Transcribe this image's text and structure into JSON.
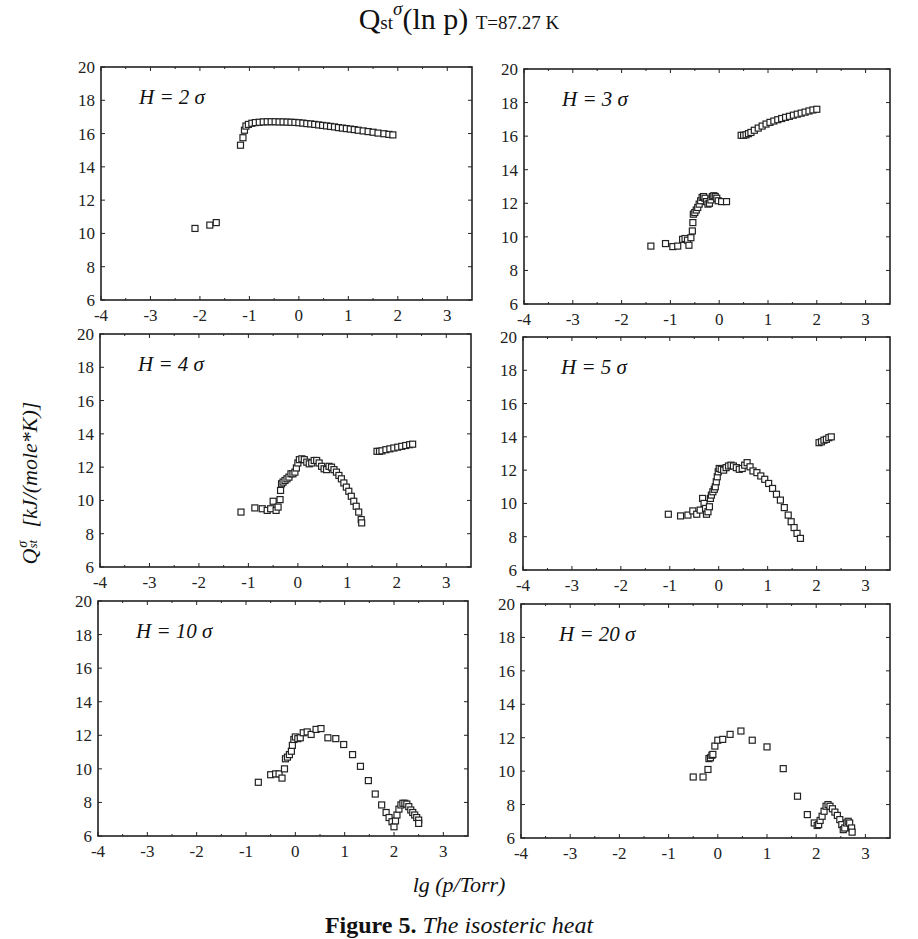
{
  "figure": {
    "title_main": "Q",
    "title_sub": "st",
    "title_sup": "σ",
    "title_rest": "(ln p)",
    "title_temp": "T=87.27 K",
    "ylabel_main": "Q",
    "ylabel_sub": "st",
    "ylabel_sup": "σ",
    "ylabel_units": "[kJ/(mole*K)]",
    "xlabel": "lg (p/Torr)",
    "caption_label": "Figure 5.",
    "caption_text": "The isosteric heat"
  },
  "chart_data": [
    {
      "type": "scatter",
      "panel": "top-left",
      "title": "H = 2 σ",
      "xlabel": "lg (p/Torr)",
      "ylabel": "Qst σ [kJ/(mole*K)]",
      "xlim": [
        -4,
        3.5
      ],
      "ylim": [
        6,
        20
      ],
      "xticks": [
        -4,
        -3,
        -2,
        -1,
        0,
        1,
        2,
        3
      ],
      "yticks": [
        6,
        8,
        10,
        12,
        14,
        16,
        18,
        20
      ],
      "marker": "open-square",
      "grid": false,
      "points": [
        [
          -2.1,
          10.3
        ],
        [
          -1.8,
          10.5
        ],
        [
          -1.67,
          10.65
        ],
        [
          -1.18,
          15.3
        ],
        [
          -1.13,
          15.75
        ],
        [
          -1.1,
          16.2
        ],
        [
          -1.07,
          16.45
        ],
        [
          -1.02,
          16.55
        ],
        [
          -0.95,
          16.62
        ],
        [
          -0.88,
          16.66
        ],
        [
          -0.8,
          16.68
        ],
        [
          -0.72,
          16.7
        ],
        [
          -0.64,
          16.71
        ],
        [
          -0.56,
          16.71
        ],
        [
          -0.48,
          16.71
        ],
        [
          -0.4,
          16.7
        ],
        [
          -0.32,
          16.7
        ],
        [
          -0.24,
          16.69
        ],
        [
          -0.16,
          16.68
        ],
        [
          -0.08,
          16.67
        ],
        [
          0.0,
          16.65
        ],
        [
          0.08,
          16.63
        ],
        [
          0.16,
          16.6
        ],
        [
          0.24,
          16.58
        ],
        [
          0.32,
          16.55
        ],
        [
          0.4,
          16.52
        ],
        [
          0.48,
          16.49
        ],
        [
          0.56,
          16.46
        ],
        [
          0.64,
          16.43
        ],
        [
          0.72,
          16.4
        ],
        [
          0.8,
          16.36
        ],
        [
          0.88,
          16.33
        ],
        [
          0.96,
          16.3
        ],
        [
          1.04,
          16.27
        ],
        [
          1.12,
          16.24
        ],
        [
          1.2,
          16.2
        ],
        [
          1.3,
          16.16
        ],
        [
          1.4,
          16.12
        ],
        [
          1.5,
          16.08
        ],
        [
          1.6,
          16.03
        ],
        [
          1.72,
          15.99
        ],
        [
          1.82,
          15.95
        ],
        [
          1.9,
          15.92
        ]
      ]
    },
    {
      "type": "scatter",
      "panel": "top-right",
      "title": "H = 3 σ",
      "xlim": [
        -4,
        3.5
      ],
      "ylim": [
        6,
        20
      ],
      "xticks": [
        -4,
        -3,
        -2,
        -1,
        0,
        1,
        2,
        3
      ],
      "yticks": [
        6,
        8,
        10,
        12,
        14,
        16,
        18,
        20
      ],
      "marker": "open-square",
      "points": [
        [
          -1.4,
          9.45
        ],
        [
          -1.1,
          9.6
        ],
        [
          -0.95,
          9.42
        ],
        [
          -0.85,
          9.45
        ],
        [
          -0.75,
          9.85
        ],
        [
          -0.7,
          9.9
        ],
        [
          -0.65,
          9.8
        ],
        [
          -0.62,
          9.5
        ],
        [
          -0.58,
          9.95
        ],
        [
          -0.55,
          10.35
        ],
        [
          -0.54,
          10.85
        ],
        [
          -0.53,
          11.35
        ],
        [
          -0.5,
          11.45
        ],
        [
          -0.47,
          11.6
        ],
        [
          -0.44,
          11.75
        ],
        [
          -0.41,
          11.95
        ],
        [
          -0.38,
          12.15
        ],
        [
          -0.35,
          12.35
        ],
        [
          -0.32,
          12.4
        ],
        [
          -0.29,
          12.3
        ],
        [
          -0.26,
          12.1
        ],
        [
          -0.23,
          11.95
        ],
        [
          -0.2,
          12.0
        ],
        [
          -0.17,
          12.2
        ],
        [
          -0.14,
          12.4
        ],
        [
          -0.11,
          12.45
        ],
        [
          -0.08,
          12.4
        ],
        [
          -0.05,
          12.3
        ],
        [
          -0.02,
          12.15
        ],
        [
          0.05,
          12.1
        ],
        [
          0.15,
          12.1
        ],
        [
          0.45,
          16.05
        ],
        [
          0.5,
          16.05
        ],
        [
          0.55,
          16.08
        ],
        [
          0.6,
          16.15
        ],
        [
          0.65,
          16.22
        ],
        [
          0.72,
          16.35
        ],
        [
          0.8,
          16.48
        ],
        [
          0.88,
          16.6
        ],
        [
          0.96,
          16.72
        ],
        [
          1.04,
          16.82
        ],
        [
          1.12,
          16.9
        ],
        [
          1.2,
          16.98
        ],
        [
          1.28,
          17.05
        ],
        [
          1.36,
          17.12
        ],
        [
          1.44,
          17.18
        ],
        [
          1.52,
          17.25
        ],
        [
          1.6,
          17.31
        ],
        [
          1.68,
          17.37
        ],
        [
          1.76,
          17.43
        ],
        [
          1.84,
          17.5
        ],
        [
          1.92,
          17.56
        ],
        [
          2.0,
          17.6
        ]
      ]
    },
    {
      "type": "scatter",
      "panel": "middle-left",
      "title": "H = 4 σ",
      "xlim": [
        -4,
        3.5
      ],
      "ylim": [
        6,
        20
      ],
      "xticks": [
        -4,
        -3,
        -2,
        -1,
        0,
        1,
        2,
        3
      ],
      "yticks": [
        6,
        8,
        10,
        12,
        14,
        16,
        18,
        20
      ],
      "marker": "open-square",
      "points": [
        [
          -1.15,
          9.3
        ],
        [
          -0.87,
          9.55
        ],
        [
          -0.72,
          9.5
        ],
        [
          -0.62,
          9.4
        ],
        [
          -0.55,
          9.5
        ],
        [
          -0.5,
          9.95
        ],
        [
          -0.44,
          9.4
        ],
        [
          -0.4,
          9.6
        ],
        [
          -0.36,
          10.05
        ],
        [
          -0.35,
          10.6
        ],
        [
          -0.33,
          11.0
        ],
        [
          -0.3,
          11.1
        ],
        [
          -0.26,
          11.2
        ],
        [
          -0.22,
          11.3
        ],
        [
          -0.18,
          11.4
        ],
        [
          -0.14,
          11.6
        ],
        [
          -0.1,
          11.6
        ],
        [
          -0.06,
          11.7
        ],
        [
          -0.03,
          11.95
        ],
        [
          0.0,
          12.25
        ],
        [
          0.03,
          12.45
        ],
        [
          0.08,
          12.5
        ],
        [
          0.13,
          12.45
        ],
        [
          0.18,
          12.3
        ],
        [
          0.23,
          12.2
        ],
        [
          0.28,
          12.25
        ],
        [
          0.33,
          12.4
        ],
        [
          0.38,
          12.4
        ],
        [
          0.43,
          12.25
        ],
        [
          0.48,
          12.05
        ],
        [
          0.53,
          11.9
        ],
        [
          0.58,
          11.85
        ],
        [
          0.63,
          12.05
        ],
        [
          0.68,
          12.0
        ],
        [
          0.73,
          11.85
        ],
        [
          0.78,
          11.7
        ],
        [
          0.83,
          11.5
        ],
        [
          0.88,
          11.3
        ],
        [
          0.93,
          11.05
        ],
        [
          0.98,
          10.8
        ],
        [
          1.03,
          10.55
        ],
        [
          1.08,
          10.25
        ],
        [
          1.13,
          9.95
        ],
        [
          1.18,
          9.65
        ],
        [
          1.23,
          9.3
        ],
        [
          1.28,
          8.85
        ],
        [
          1.29,
          8.65
        ],
        [
          1.6,
          12.95
        ],
        [
          1.65,
          12.95
        ],
        [
          1.7,
          12.98
        ],
        [
          1.78,
          13.05
        ],
        [
          1.86,
          13.1
        ],
        [
          1.94,
          13.15
        ],
        [
          2.02,
          13.2
        ],
        [
          2.1,
          13.25
        ],
        [
          2.18,
          13.3
        ],
        [
          2.26,
          13.35
        ],
        [
          2.32,
          13.38
        ]
      ]
    },
    {
      "type": "scatter",
      "panel": "middle-right",
      "title": "H = 5 σ",
      "xlim": [
        -4,
        3.5
      ],
      "ylim": [
        6,
        20
      ],
      "xticks": [
        -4,
        -3,
        -2,
        -1,
        0,
        1,
        2,
        3
      ],
      "yticks": [
        6,
        8,
        10,
        12,
        14,
        16,
        18,
        20
      ],
      "marker": "open-square",
      "points": [
        [
          -1.03,
          9.35
        ],
        [
          -0.78,
          9.25
        ],
        [
          -0.63,
          9.3
        ],
        [
          -0.53,
          9.55
        ],
        [
          -0.45,
          9.35
        ],
        [
          -0.38,
          9.6
        ],
        [
          -0.33,
          10.3
        ],
        [
          -0.3,
          10.0
        ],
        [
          -0.27,
          9.7
        ],
        [
          -0.25,
          9.35
        ],
        [
          -0.22,
          9.5
        ],
        [
          -0.19,
          9.8
        ],
        [
          -0.17,
          10.3
        ],
        [
          -0.15,
          10.5
        ],
        [
          -0.12,
          10.7
        ],
        [
          -0.09,
          10.85
        ],
        [
          -0.07,
          11.0
        ],
        [
          -0.05,
          11.3
        ],
        [
          -0.03,
          11.6
        ],
        [
          -0.01,
          11.9
        ],
        [
          0.01,
          12.1
        ],
        [
          0.05,
          12.05
        ],
        [
          0.1,
          12.0
        ],
        [
          0.15,
          12.15
        ],
        [
          0.2,
          12.25
        ],
        [
          0.25,
          12.3
        ],
        [
          0.3,
          12.25
        ],
        [
          0.36,
          12.15
        ],
        [
          0.42,
          12.05
        ],
        [
          0.48,
          12.1
        ],
        [
          0.53,
          12.3
        ],
        [
          0.58,
          12.45
        ],
        [
          0.64,
          12.2
        ],
        [
          0.7,
          11.95
        ],
        [
          0.78,
          11.85
        ],
        [
          0.86,
          11.65
        ],
        [
          0.94,
          11.45
        ],
        [
          1.02,
          11.2
        ],
        [
          1.1,
          10.9
        ],
        [
          1.18,
          10.55
        ],
        [
          1.26,
          10.2
        ],
        [
          1.34,
          9.75
        ],
        [
          1.42,
          9.3
        ],
        [
          1.48,
          8.9
        ],
        [
          1.54,
          8.55
        ],
        [
          1.6,
          8.2
        ],
        [
          1.67,
          7.9
        ],
        [
          2.05,
          13.65
        ],
        [
          2.1,
          13.7
        ],
        [
          2.15,
          13.8
        ],
        [
          2.2,
          13.85
        ],
        [
          2.25,
          13.95
        ],
        [
          2.3,
          14.0
        ]
      ]
    },
    {
      "type": "scatter",
      "panel": "bottom-left",
      "title": "H = 10 σ",
      "xlim": [
        -4,
        3.5
      ],
      "ylim": [
        6,
        20
      ],
      "xticks": [
        -4,
        -3,
        -2,
        -1,
        0,
        1,
        2,
        3
      ],
      "yticks": [
        6,
        8,
        10,
        12,
        14,
        16,
        18,
        20
      ],
      "marker": "open-square",
      "points": [
        [
          -0.75,
          9.2
        ],
        [
          -0.5,
          9.65
        ],
        [
          -0.4,
          9.7
        ],
        [
          -0.33,
          9.7
        ],
        [
          -0.27,
          9.45
        ],
        [
          -0.22,
          10.0
        ],
        [
          -0.2,
          10.6
        ],
        [
          -0.16,
          10.7
        ],
        [
          -0.12,
          10.85
        ],
        [
          -0.08,
          11.05
        ],
        [
          -0.06,
          11.4
        ],
        [
          -0.03,
          11.75
        ],
        [
          0.0,
          11.9
        ],
        [
          0.05,
          11.8
        ],
        [
          0.1,
          11.85
        ],
        [
          0.16,
          12.15
        ],
        [
          0.24,
          12.2
        ],
        [
          0.32,
          12.05
        ],
        [
          0.42,
          12.35
        ],
        [
          0.52,
          12.4
        ],
        [
          0.66,
          11.85
        ],
        [
          0.82,
          11.8
        ],
        [
          0.98,
          11.45
        ],
        [
          1.16,
          10.85
        ],
        [
          1.32,
          10.15
        ],
        [
          1.48,
          9.3
        ],
        [
          1.62,
          8.5
        ],
        [
          1.75,
          7.85
        ],
        [
          1.84,
          7.4
        ],
        [
          1.9,
          7.1
        ],
        [
          1.96,
          6.85
        ],
        [
          2.0,
          6.55
        ],
        [
          2.03,
          6.9
        ],
        [
          2.06,
          7.25
        ],
        [
          2.1,
          7.6
        ],
        [
          2.14,
          7.85
        ],
        [
          2.18,
          7.95
        ],
        [
          2.22,
          7.95
        ],
        [
          2.26,
          7.9
        ],
        [
          2.3,
          7.75
        ],
        [
          2.34,
          7.55
        ],
        [
          2.38,
          7.4
        ],
        [
          2.42,
          7.25
        ],
        [
          2.46,
          7.1
        ],
        [
          2.5,
          6.95
        ],
        [
          2.5,
          6.75
        ]
      ]
    },
    {
      "type": "scatter",
      "panel": "bottom-right",
      "title": "H = 20 σ",
      "xlim": [
        -4,
        3.5
      ],
      "ylim": [
        6,
        20
      ],
      "xticks": [
        -4,
        -3,
        -2,
        -1,
        0,
        1,
        2,
        3
      ],
      "yticks": [
        6,
        8,
        10,
        12,
        14,
        16,
        18,
        20
      ],
      "marker": "open-square",
      "points": [
        [
          -0.5,
          9.65
        ],
        [
          -0.3,
          9.65
        ],
        [
          -0.2,
          10.1
        ],
        [
          -0.18,
          10.75
        ],
        [
          -0.15,
          10.8
        ],
        [
          -0.12,
          10.95
        ],
        [
          -0.1,
          11.0
        ],
        [
          -0.06,
          11.5
        ],
        [
          0.0,
          11.85
        ],
        [
          0.1,
          11.9
        ],
        [
          0.25,
          12.2
        ],
        [
          0.47,
          12.4
        ],
        [
          0.7,
          11.85
        ],
        [
          1.0,
          11.45
        ],
        [
          1.33,
          10.15
        ],
        [
          1.62,
          8.5
        ],
        [
          1.82,
          7.4
        ],
        [
          1.96,
          6.9
        ],
        [
          2.02,
          6.75
        ],
        [
          2.05,
          6.8
        ],
        [
          2.08,
          7.05
        ],
        [
          2.12,
          7.3
        ],
        [
          2.16,
          7.6
        ],
        [
          2.2,
          7.9
        ],
        [
          2.24,
          8.0
        ],
        [
          2.28,
          7.9
        ],
        [
          2.33,
          7.75
        ],
        [
          2.38,
          7.55
        ],
        [
          2.43,
          7.35
        ],
        [
          2.48,
          7.1
        ],
        [
          2.52,
          6.8
        ],
        [
          2.55,
          6.5
        ],
        [
          2.58,
          6.6
        ],
        [
          2.62,
          6.9
        ],
        [
          2.65,
          7.0
        ],
        [
          2.68,
          6.9
        ],
        [
          2.72,
          6.6
        ],
        [
          2.73,
          6.35
        ]
      ]
    }
  ]
}
